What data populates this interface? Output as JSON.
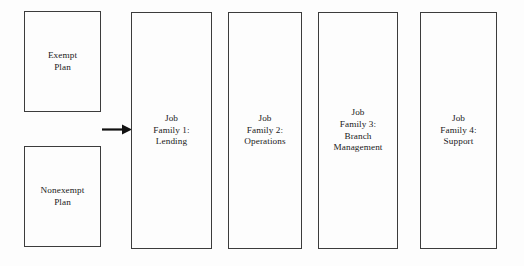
{
  "diagram": {
    "canvas": {
      "width": 524,
      "height": 266
    },
    "colors": {
      "background": "#fdfdfd",
      "border": "#3c3c3c",
      "text": "#19191a",
      "arrow": "#111111"
    },
    "plan_boxes": [
      {
        "id": "exempt-plan",
        "label": "Exempt\nPlan",
        "x": 24,
        "y": 11,
        "width": 77,
        "height": 101
      },
      {
        "id": "nonexempt-plan",
        "label": "Nonexempt\nPlan",
        "x": 24,
        "y": 146,
        "width": 77,
        "height": 101
      }
    ],
    "family_boxes": [
      {
        "id": "job-family-1",
        "label": "Job\nFamily 1:\nLending",
        "x": 131,
        "y": 12,
        "width": 81,
        "height": 237
      },
      {
        "id": "job-family-2",
        "label": "Job\nFamily 2:\nOperations",
        "x": 228,
        "y": 12,
        "width": 74,
        "height": 237
      },
      {
        "id": "job-family-3",
        "label": "Job\nFamily 3:\nBranch\nManagement",
        "x": 318,
        "y": 12,
        "width": 80,
        "height": 237
      },
      {
        "id": "job-family-4",
        "label": "Job\nFamily 4:\nSupport",
        "x": 420,
        "y": 12,
        "width": 77,
        "height": 237
      }
    ],
    "connectors": [
      {
        "id": "plans-to-families-arrow",
        "type": "arrow-right",
        "x1": 102,
        "y1": 129,
        "x2": 130,
        "y2": 129
      }
    ]
  }
}
